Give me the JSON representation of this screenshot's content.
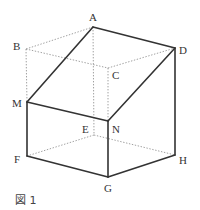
{
  "figure": {
    "caption": "図 1",
    "vertices": {
      "A": {
        "label": "A",
        "x": 93,
        "y": 27,
        "lx": 89,
        "ly": 21
      },
      "B": {
        "label": "B",
        "x": 26,
        "y": 49,
        "lx": 13,
        "ly": 50
      },
      "C": {
        "label": "C",
        "x": 108,
        "y": 68,
        "lx": 112,
        "ly": 79
      },
      "D": {
        "label": "D",
        "x": 175,
        "y": 48,
        "lx": 179,
        "ly": 54
      },
      "M": {
        "label": "M",
        "x": 27,
        "y": 102,
        "lx": 12,
        "ly": 107
      },
      "N": {
        "label": "N",
        "x": 108,
        "y": 121,
        "lx": 112,
        "ly": 133
      },
      "E": {
        "label": "E",
        "x": 94,
        "y": 135,
        "lx": 82,
        "ly": 133
      },
      "F": {
        "label": "F",
        "x": 27,
        "y": 156,
        "lx": 14,
        "ly": 163
      },
      "G": {
        "label": "G",
        "x": 108,
        "y": 177,
        "lx": 104,
        "ly": 192
      },
      "H": {
        "label": "H",
        "x": 175,
        "y": 155,
        "lx": 179,
        "ly": 164
      }
    },
    "solid_edges": [
      [
        "A",
        "D"
      ],
      [
        "A",
        "M"
      ],
      [
        "D",
        "N"
      ],
      [
        "M",
        "N"
      ],
      [
        "M",
        "F"
      ],
      [
        "N",
        "G"
      ],
      [
        "D",
        "H"
      ],
      [
        "F",
        "G"
      ],
      [
        "G",
        "H"
      ]
    ],
    "hidden_edges": [
      [
        "A",
        "B"
      ],
      [
        "B",
        "C"
      ],
      [
        "C",
        "D"
      ],
      [
        "A",
        "E"
      ],
      [
        "B",
        "M"
      ],
      [
        "C",
        "N"
      ],
      [
        "E",
        "F"
      ],
      [
        "E",
        "H"
      ]
    ],
    "colors": {
      "solid": "#333333",
      "hidden": "#888888",
      "text": "#333333"
    }
  }
}
